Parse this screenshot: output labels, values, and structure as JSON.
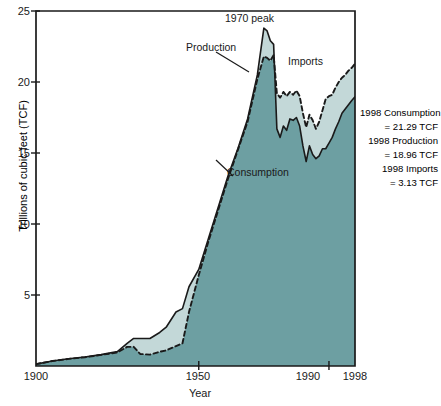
{
  "chart_data": {
    "type": "area",
    "title": "",
    "xlabel": "Year",
    "ylabel": "Trillions of cubic feet (TCF)",
    "xlim": [
      1900,
      1998
    ],
    "ylim": [
      0,
      25
    ],
    "xticks": [
      "1900",
      "1950",
      "1990",
      "1998"
    ],
    "xtick_values": [
      1900,
      1950,
      1990,
      1998
    ],
    "yticks": [
      "0",
      "5",
      "10",
      "15",
      "20",
      "25"
    ],
    "ytick_values": [
      0,
      5,
      10,
      15,
      20,
      25
    ],
    "grid": false,
    "legend_position": "inline-annotations",
    "series": [
      {
        "name": "Production",
        "style": "solid-line",
        "x": [
          1900,
          1905,
          1910,
          1915,
          1920,
          1925,
          1928,
          1930,
          1932,
          1935,
          1938,
          1940,
          1943,
          1945,
          1947,
          1950,
          1953,
          1956,
          1959,
          1962,
          1965,
          1968,
          1970,
          1971,
          1972,
          1973,
          1974,
          1975,
          1976,
          1977,
          1978,
          1979,
          1980,
          1981,
          1982,
          1983,
          1984,
          1985,
          1986,
          1987,
          1988,
          1989,
          1990,
          1991,
          1992,
          1993,
          1994,
          1995,
          1996,
          1997,
          1998
        ],
        "values": [
          0.13,
          0.35,
          0.51,
          0.63,
          0.8,
          1.01,
          1.6,
          1.94,
          1.94,
          1.94,
          2.36,
          2.73,
          3.8,
          4.04,
          5.58,
          6.8,
          9.0,
          11.2,
          13.4,
          15.3,
          17.4,
          20.5,
          23.79,
          23.6,
          22.9,
          22.65,
          16.7,
          16.1,
          16.9,
          16.6,
          17.4,
          17.3,
          17.5,
          16.9,
          15.5,
          14.4,
          15.5,
          14.9,
          14.6,
          14.8,
          15.3,
          15.3,
          15.7,
          16.1,
          16.7,
          17.2,
          17.8,
          18.1,
          18.4,
          18.7,
          18.96
        ]
      },
      {
        "name": "Consumption",
        "style": "dashed-line",
        "x": [
          1900,
          1905,
          1910,
          1915,
          1920,
          1925,
          1928,
          1930,
          1932,
          1935,
          1938,
          1940,
          1943,
          1945,
          1947,
          1950,
          1953,
          1956,
          1959,
          1962,
          1965,
          1968,
          1970,
          1971,
          1972,
          1973,
          1974,
          1975,
          1976,
          1977,
          1978,
          1979,
          1980,
          1981,
          1982,
          1983,
          1984,
          1985,
          1986,
          1987,
          1988,
          1989,
          1990,
          1991,
          1992,
          1993,
          1994,
          1995,
          1996,
          1997,
          1998
        ],
        "values": [
          0.13,
          0.35,
          0.5,
          0.62,
          0.78,
          0.95,
          1.35,
          1.35,
          0.85,
          0.8,
          1.0,
          1.1,
          1.4,
          1.6,
          3.8,
          6.4,
          8.8,
          11.0,
          13.2,
          15.2,
          17.2,
          20.2,
          21.8,
          21.7,
          21.5,
          21.9,
          19.2,
          18.9,
          19.3,
          19.0,
          19.3,
          19.1,
          19.4,
          19.0,
          17.8,
          16.8,
          17.7,
          17.3,
          16.7,
          17.2,
          18.0,
          18.8,
          19.0,
          19.1,
          19.6,
          20.0,
          20.3,
          20.5,
          20.8,
          21.0,
          21.29
        ]
      }
    ],
    "areas": [
      {
        "name": "Consumption area",
        "fill_color": "#6d9fa2"
      },
      {
        "name": "Imports gap (between production and consumption)",
        "fill_color": "#c3d8d8"
      }
    ],
    "annotations": [
      {
        "name": "peak-label",
        "text": "1970 peak",
        "x": 1970,
        "y": 25.0
      },
      {
        "name": "production-label",
        "text": "Production",
        "x": 1948,
        "y": 22.3
      },
      {
        "name": "imports-label",
        "text": "Imports",
        "x": 1976,
        "y": 20.3
      },
      {
        "name": "consumption-label",
        "text": "Consumption",
        "x": 1952,
        "y": 12.0
      }
    ],
    "side_notes": [
      "1998 Consumption",
      "= 21.29 TCF",
      "1998 Production",
      "= 18.96 TCF",
      "1998 Imports",
      "= 3.13 TCF"
    ],
    "colors": {
      "consumption_fill": "#6d9fa2",
      "imports_fill": "#c3d8d8",
      "line": "#1a1a1a",
      "axis": "#1a1a1a",
      "background": "#ffffff"
    }
  }
}
